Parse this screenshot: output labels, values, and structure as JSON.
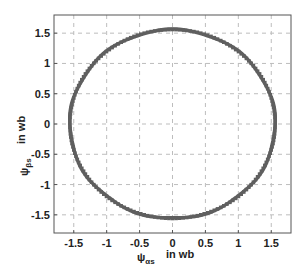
{
  "chart_data": {
    "type": "scatter",
    "title": "",
    "xlabel": "ψαs in wb",
    "ylabel": "ψβs in wb",
    "xlabel_parts": {
      "symbol": "ψ",
      "subscript": "αs",
      "unit_text": "in   wb"
    },
    "ylabel_parts": {
      "symbol": "ψ",
      "subscript": "βs",
      "unit_text": "in   wb"
    },
    "xlim": [
      -1.8,
      1.8
    ],
    "ylim": [
      -1.8,
      1.8
    ],
    "xticks": [
      -1.5,
      -1,
      -0.5,
      0,
      0.5,
      1,
      1.5
    ],
    "yticks": [
      -1.5,
      -1,
      -0.5,
      0,
      0.5,
      1,
      1.5
    ],
    "xtick_labels": [
      "-1.5",
      "-1",
      "-0.5",
      "0",
      "0.5",
      "1",
      "1.5"
    ],
    "ytick_labels": [
      "-1.5",
      "-1",
      "-0.5",
      "0",
      "0.5",
      "1",
      "1.5"
    ],
    "grid": true,
    "grid_style": "dashed",
    "legend": null,
    "series": [
      {
        "name": "stator flux trajectory",
        "shape": "circle",
        "center": [
          0,
          0
        ],
        "radius": 1.56,
        "points": 180,
        "color": "#5f5f5f",
        "marker": "dense square markers"
      }
    ]
  }
}
